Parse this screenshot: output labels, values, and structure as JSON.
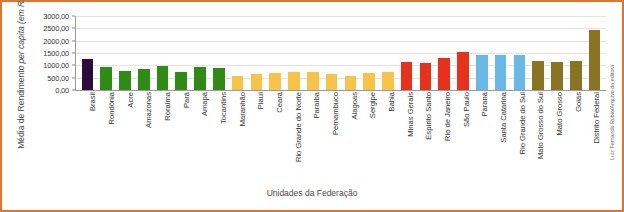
{
  "chart_data": {
    "type": "bar",
    "title": "",
    "xlabel": "Unidades da Federação",
    "ylabel_line1": "Média de Rendimento",
    "ylabel_line2": "per capita (em R$)",
    "ylim": [
      0,
      3000
    ],
    "ytick_labels": [
      "3000,00",
      "2500,00",
      "2000,00",
      "1500,00",
      "1000,00",
      "500,00",
      "0,00"
    ],
    "ytick_values": [
      3000,
      2500,
      2000,
      1500,
      1000,
      500,
      0
    ],
    "grid": true,
    "legend": "none",
    "categories": [
      "Brasil",
      "Rondônia",
      "Acre",
      "Amazonas",
      "Roraima",
      "Pará",
      "Amapá",
      "Tocantins",
      "Maranhão",
      "Piauí",
      "Ceará",
      "Rio Grande do Norte",
      "Paraíba",
      "Pernambuco",
      "Alagoas",
      "Sergipe",
      "Bahia",
      "Minas Gerais",
      "Espírito Santo",
      "Rio de Janeiro",
      "São Paulo",
      "Paraná",
      "Santa Catarina",
      "Rio Grande do Sul",
      "Mato Grosso do Sul",
      "Mato Grosso",
      "Goiás",
      "Distrito Federal"
    ],
    "values": [
      1255,
      935,
      790,
      870,
      975,
      745,
      915,
      900,
      565,
      650,
      700,
      730,
      740,
      650,
      570,
      680,
      730,
      1120,
      1090,
      1290,
      1545,
      1400,
      1415,
      1420,
      1160,
      1135,
      1165,
      2450
    ],
    "bar_colors": [
      "#2d0b3c",
      "#2f8c12",
      "#2f8c12",
      "#2f8c12",
      "#2f8c12",
      "#2f8c12",
      "#2f8c12",
      "#2f8c12",
      "#f8c445",
      "#f8c445",
      "#f8c445",
      "#f8c445",
      "#f8c445",
      "#f8c445",
      "#f8c445",
      "#f8c445",
      "#f8c445",
      "#e8301b",
      "#e8301b",
      "#e8301b",
      "#e8301b",
      "#68b9e8",
      "#68b9e8",
      "#68b9e8",
      "#8a7321",
      "#8a7321",
      "#8a7321",
      "#8a7321"
    ]
  },
  "credit": "Luiz Fernando Rubio/Arquivo da editora",
  "colors": {
    "frame": "#e0762a",
    "axis": "#9a9a9a",
    "grid": "#e3e3e3",
    "brasil": "#2d0b3c",
    "north": "#2f8c12",
    "northeast": "#f8c445",
    "southeast": "#e8301b",
    "south": "#68b9e8",
    "centerwest": "#8a7321"
  }
}
